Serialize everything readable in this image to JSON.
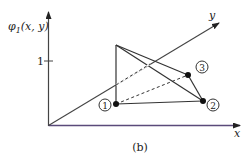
{
  "figure": {
    "caption": "(b)",
    "axes": {
      "vertical_label": "φ1(x, y)",
      "vertical_label_main": "φ",
      "vertical_label_sub": "1",
      "vertical_label_args": "(x, y)",
      "tick_label": "1",
      "x_label": "x",
      "y_label": "y"
    },
    "nodes": [
      {
        "id": "1",
        "label": "1"
      },
      {
        "id": "2",
        "label": "2"
      },
      {
        "id": "3",
        "label": "3"
      }
    ],
    "colors": {
      "line": "#333333",
      "node": "#111111",
      "axis_x": "#5a4a7a"
    }
  }
}
